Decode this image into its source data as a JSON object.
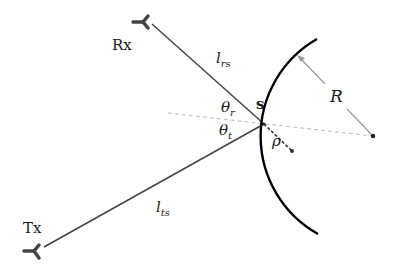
{
  "diagram": {
    "type": "bistatic scattering geometry",
    "nodes": {
      "rx": {
        "label": "Rx",
        "antenna_tip": [
          150,
          22
        ]
      },
      "tx": {
        "label": "Tx",
        "antenna_tip": [
          42,
          248
        ]
      },
      "scatter_point": {
        "label": "s",
        "position": [
          264,
          124
        ]
      },
      "center": {
        "position": [
          373,
          136
        ]
      },
      "rho_point": {
        "position": [
          292,
          151
        ]
      }
    },
    "edges": {
      "rx_to_s": {
        "label_main": "l",
        "label_sub": "rs"
      },
      "tx_to_s": {
        "label_main": "l",
        "label_sub": "ts"
      },
      "radius": {
        "label": "R"
      },
      "rho": {
        "label": "ρ"
      }
    },
    "angles": {
      "theta_r": {
        "label_main": "θ",
        "label_sub": "r"
      },
      "theta_t": {
        "label_main": "θ",
        "label_sub": "t"
      }
    },
    "colors": {
      "line": "#444444",
      "antenna": "#444444",
      "arc": "#000000",
      "dashed": "#bbbbbb",
      "arrow": "#999999"
    }
  }
}
